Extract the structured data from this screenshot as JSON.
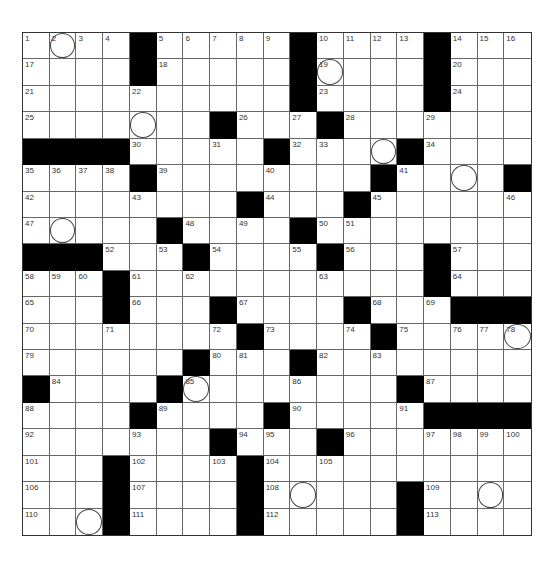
{
  "puzzle": {
    "rows": 19,
    "cols": 19,
    "grid": [
      "1 2o 3 4 # 5 6 7 8 9 # 10 11 12 13 # 14 15 16",
      "17 . . . # 18 . . . . # 19o . . . # 20 . .",
      "21 . . . 22 . . . . . # 23 . . . # 24 . .",
      "25 . . . o . . # 26 . 27 # 28 . . 29 . . .",
      "# # # # 30 . . 31 . # 32 33 . o # 34 . . .",
      "35 36 37 38 # 39 . . . 40 . . . # 41 . o . #",
      "42 . . . 43 . . . # 44 . . # 45 . . . . 46",
      "47 o . . . # 48 . 49 . # 50 51 . . . . . .",
      "# # # 52 . 53 # 54 . . 55 # 56 . . # 57 . .",
      "58 59 60 # 61 . 62 . . . . 63 . . . # 64 . .",
      "65 . . # 66 . . # 67 . . . # 68 . 69 # # #",
      "70 . . 71 . . . 72 # 73 . . 74 # 75 . 76 77 78o",
      "79 . . . . . # 80 81 . # 82 . 83 . . . . .",
      "# 84 . . . # 85o . . . 86 . . . # 87 . . .",
      "88 . . . # 89 . . . # 90 . . . 91 # # # #",
      "92 . . . 93 . . # 94 95 . # 96 . . 97 98 99 100",
      "101 . . # 102 . . 103 # 104 . 105 . . . . . . .",
      "106 . . # 107 . . . # 108 o . . . # 109 . o .",
      "110 . o # 111 . . . # 112 . . . . # 113 . . ."
    ],
    "legend": {
      "#": "black square",
      ".": "empty white square",
      "o": "empty white square with circle",
      "Nn": "numbered square",
      "No": "numbered square with circle"
    },
    "colors": {
      "black_cell": "#000000",
      "white_cell": "#ffffff",
      "grid_line": "#666666"
    }
  }
}
